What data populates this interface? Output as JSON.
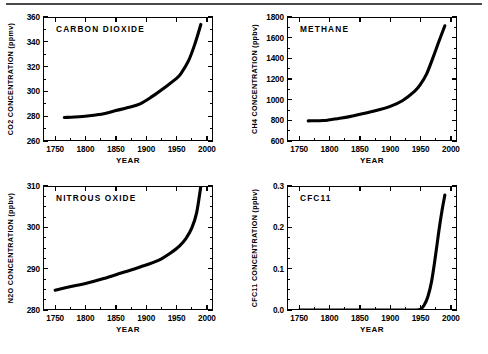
{
  "figure": {
    "panel_count": 4,
    "xlabel": "YEAR",
    "x_ticks": [
      "1750",
      "1800",
      "1850",
      "1900",
      "1950",
      "2000"
    ],
    "line_color": "#000000",
    "background_color": "#ffffff"
  },
  "chart_data": [
    {
      "type": "line",
      "title": "CARBON  DIOXIDE",
      "ylabel": "CO2  CONCENTRATION  (ppmv)",
      "xlabel": "YEAR",
      "ylim": [
        260,
        360
      ],
      "xlim": [
        1730,
        2010
      ],
      "y_ticks": [
        "260",
        "280",
        "300",
        "320",
        "340",
        "360"
      ],
      "y_tick_values": [
        260,
        280,
        300,
        320,
        340,
        360
      ],
      "y_minor_step": 10,
      "x_ticks": [
        "1750",
        "1800",
        "1850",
        "1900",
        "1950",
        "2000"
      ],
      "x_tick_values": [
        1750,
        1800,
        1850,
        1900,
        1950,
        2000
      ],
      "x_minor_step": 25,
      "grid": false,
      "legend": "none",
      "x": [
        1765,
        1790,
        1810,
        1830,
        1850,
        1870,
        1890,
        1910,
        1930,
        1950,
        1958,
        1970,
        1980,
        1990
      ],
      "values": [
        279,
        279.5,
        280.5,
        282,
        284.5,
        287,
        290,
        296,
        303,
        310.5,
        315,
        325,
        338,
        354
      ]
    },
    {
      "type": "line",
      "title": "METHANE",
      "ylabel": "CH4  CONCENTRATION  (ppbv)",
      "xlabel": "YEAR",
      "ylim": [
        600,
        1800
      ],
      "xlim": [
        1730,
        2010
      ],
      "y_ticks": [
        "600",
        "800",
        "1000",
        "1200",
        "1400",
        "1600",
        "1800"
      ],
      "y_tick_values": [
        600,
        800,
        1000,
        1200,
        1400,
        1600,
        1800
      ],
      "y_minor_step": 100,
      "x_ticks": [
        "1750",
        "1800",
        "1850",
        "1900",
        "1950",
        "2000"
      ],
      "x_tick_values": [
        1750,
        1800,
        1850,
        1900,
        1950,
        2000
      ],
      "x_minor_step": 25,
      "grid": false,
      "legend": "none",
      "x": [
        1765,
        1790,
        1800,
        1820,
        1840,
        1860,
        1880,
        1900,
        1920,
        1940,
        1950,
        1960,
        1970,
        1980,
        1990
      ],
      "values": [
        795,
        798,
        805,
        822,
        845,
        872,
        900,
        935,
        990,
        1080,
        1150,
        1250,
        1400,
        1560,
        1715
      ]
    },
    {
      "type": "line",
      "title": "NITROUS  OXIDE",
      "ylabel": "N2O  CONCENTRATION  (ppbv)",
      "xlabel": "YEAR",
      "ylim": [
        280,
        310
      ],
      "xlim": [
        1730,
        2010
      ],
      "y_ticks": [
        "280",
        "290",
        "300",
        "310"
      ],
      "y_tick_values": [
        280,
        290,
        300,
        310
      ],
      "y_minor_step": 2.5,
      "x_ticks": [
        "1750",
        "1800",
        "1850",
        "1900",
        "1950",
        "2000"
      ],
      "x_tick_values": [
        1750,
        1800,
        1850,
        1900,
        1950,
        2000
      ],
      "x_minor_step": 25,
      "grid": false,
      "legend": "none",
      "x": [
        1750,
        1780,
        1800,
        1830,
        1860,
        1890,
        1920,
        1945,
        1955,
        1965,
        1975,
        1983,
        1990
      ],
      "values": [
        284.8,
        285.8,
        286.4,
        287.6,
        289.0,
        290.4,
        292.0,
        294.3,
        295.5,
        297.2,
        299.8,
        303.5,
        310
      ]
    },
    {
      "type": "line",
      "title": "CFC11",
      "ylabel": "CFC11  CONCENTRATION  (ppbv)",
      "xlabel": "YEAR",
      "ylim": [
        0.0,
        0.3
      ],
      "xlim": [
        1730,
        2010
      ],
      "y_ticks": [
        "0.0",
        "0.1",
        "0.2",
        "0.3"
      ],
      "y_tick_values": [
        0.0,
        0.1,
        0.2,
        0.3
      ],
      "y_minor_step": 0.025,
      "x_ticks": [
        "1750",
        "1800",
        "1850",
        "1900",
        "1950",
        "2000"
      ],
      "x_tick_values": [
        1750,
        1800,
        1850,
        1900,
        1950,
        2000
      ],
      "x_minor_step": 25,
      "grid": false,
      "legend": "none",
      "x": [
        1750,
        1900,
        1940,
        1950,
        1956,
        1962,
        1968,
        1974,
        1980,
        1985,
        1990
      ],
      "values": [
        0.0,
        0.0,
        0.0,
        0.002,
        0.012,
        0.032,
        0.068,
        0.125,
        0.19,
        0.238,
        0.278
      ]
    }
  ]
}
